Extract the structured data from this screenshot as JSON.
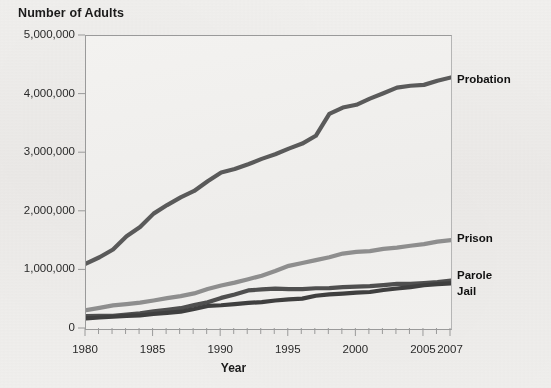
{
  "chart_data": {
    "type": "line",
    "title": "",
    "ylabel": "Number of Adults",
    "xlabel": "Year",
    "ylim": [
      0,
      5000000
    ],
    "xlim": [
      1980,
      2007
    ],
    "grid": false,
    "legend_position": "right-of-axis-inline",
    "y_ticks": [
      0,
      1000000,
      2000000,
      3000000,
      4000000,
      5000000
    ],
    "y_tick_labels": [
      "0",
      "1,000,000",
      "2,000,000",
      "3,000,000",
      "4,000,000",
      "5,000,000"
    ],
    "x_ticks": [
      1980,
      1985,
      1990,
      1995,
      2000,
      2005,
      2007
    ],
    "x_tick_labels": [
      "1980",
      "1985",
      "1990",
      "1995",
      "2000",
      "2005",
      "2007"
    ],
    "x_minor_tick_interval": 1,
    "x": [
      1980,
      1981,
      1982,
      1983,
      1984,
      1985,
      1986,
      1987,
      1988,
      1989,
      1990,
      1991,
      1992,
      1993,
      1994,
      1995,
      1996,
      1997,
      1998,
      1999,
      2000,
      2001,
      2002,
      2003,
      2004,
      2005,
      2006,
      2007
    ],
    "series": [
      {
        "name": "Probation",
        "color": "#5a5a5a",
        "values": [
          1118000,
          1225000,
          1357000,
          1582000,
          1740000,
          1969000,
          2115000,
          2247000,
          2356000,
          2522000,
          2670000,
          2729000,
          2812000,
          2903000,
          2981000,
          3078000,
          3164000,
          3297000,
          3671000,
          3779000,
          3826000,
          3932000,
          4024000,
          4120000,
          4151000,
          4166000,
          4237000,
          4293000
        ]
      },
      {
        "name": "Prison",
        "color": "#8e8e8e",
        "values": [
          320000,
          360000,
          402000,
          424000,
          449000,
          487000,
          526000,
          562000,
          607000,
          683000,
          743000,
          792000,
          850000,
          909000,
          990000,
          1078000,
          1127000,
          1176000,
          1224000,
          1287000,
          1316000,
          1330000,
          1367000,
          1390000,
          1421000,
          1448000,
          1492000,
          1518000
        ]
      },
      {
        "name": "Parole",
        "color": "#4f4f4f",
        "values": [
          220000,
          225000,
          224000,
          246000,
          266000,
          300000,
          327000,
          355000,
          407000,
          456000,
          531000,
          590000,
          658000,
          676000,
          690000,
          679000,
          679000,
          695000,
          696000,
          714000,
          724000,
          732000,
          750000,
          769000,
          771000,
          784000,
          799000,
          824000
        ]
      },
      {
        "name": "Jail",
        "color": "#3f3f3f",
        "values": [
          182000,
          196000,
          209000,
          223000,
          234000,
          256000,
          274000,
          295000,
          341000,
          393000,
          405000,
          426000,
          445000,
          459000,
          486000,
          507000,
          518000,
          567000,
          592000,
          605000,
          621000,
          631000,
          665000,
          691000,
          714000,
          747000,
          766000,
          780000
        ]
      }
    ],
    "series_labels": [
      {
        "name": "Probation",
        "top_px": 73
      },
      {
        "name": "Prison",
        "top_px": 232
      },
      {
        "name": "Parole",
        "top_px": 269
      },
      {
        "name": "Jail",
        "top_px": 285
      }
    ]
  },
  "colors": {
    "background": "#efeeec",
    "plot_background": "#f1f0ee",
    "axis": "#9a9a9a",
    "text": "#1b1b1b"
  }
}
